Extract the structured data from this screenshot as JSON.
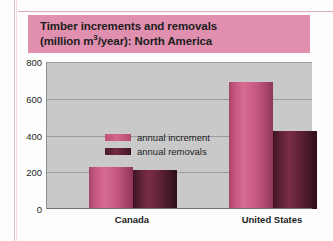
{
  "chart_data": {
    "type": "bar",
    "title": "Timber increments and removals (million m3/year): North America",
    "title_line1": "Timber increments and removals",
    "title_line2_pre": "(million m",
    "title_line2_sup": "3",
    "title_line2_post": "/year): North America",
    "xlabel": "",
    "ylabel": "",
    "ylim": [
      0,
      800
    ],
    "yticks": [
      0,
      200,
      400,
      600,
      800
    ],
    "ytick_labels": [
      "0",
      "200",
      "400",
      "600",
      "800"
    ],
    "grid": true,
    "legend_position": "top-left inside plot",
    "categories": [
      "Canada",
      "United States"
    ],
    "series": [
      {
        "name": "annual increment",
        "color": "#c8567f",
        "values": [
          230,
          690
        ]
      },
      {
        "name": "annual removals",
        "color": "#5c2035",
        "values": [
          215,
          425
        ]
      }
    ]
  },
  "colors": {
    "title_band": "#e08fae",
    "plot_background": "#c9c9c9",
    "gridline": "#9b9b9b",
    "increment": "#c8567f",
    "removals": "#5c2035",
    "page_rule": "#e0a9bf"
  }
}
